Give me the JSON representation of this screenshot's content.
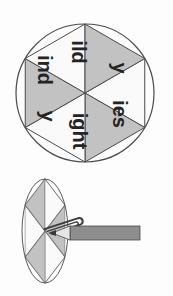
{
  "document": {
    "title": "Word Ending Spinner Worksheet",
    "orientation": "rotated-90-clockwise",
    "background_color": "#fdfdfd"
  },
  "palette": {
    "sector_gray": "#c2c2c2",
    "sector_white": "#fafafa",
    "outline": "#4a4a4a",
    "text": "#242424",
    "pencil_body": "#8e8e8e",
    "pencil_wood": "#e6e6e6",
    "pencil_lead": "#3a3a3a",
    "paperclip": "#3d3d3d"
  },
  "main_spinner": {
    "name": "word-ending-spinner",
    "shape": "circle",
    "sector_count": 6,
    "center_x": 85,
    "center_y": 93,
    "radius": 69,
    "sectors": [
      {
        "label": "ild",
        "fill": "white",
        "start_angle": -30,
        "end_angle": 30,
        "label_angle": 0,
        "label_radius": 41
      },
      {
        "label": "y",
        "fill": "gray",
        "start_angle": 30,
        "end_angle": 90,
        "label_angle": 60,
        "label_radius": 41
      },
      {
        "label": "ies",
        "fill": "white",
        "start_angle": 90,
        "end_angle": 150,
        "label_angle": 120,
        "label_radius": 41
      },
      {
        "label": "ight",
        "fill": "gray",
        "start_angle": 150,
        "end_angle": 210,
        "label_angle": 180,
        "label_radius": 41
      },
      {
        "label": "y",
        "fill": "white",
        "start_angle": 210,
        "end_angle": 270,
        "label_angle": 240,
        "label_radius": 41
      },
      {
        "label": "ind",
        "fill": "gray",
        "start_angle": 270,
        "end_angle": 330,
        "label_angle": 300,
        "label_radius": 41
      }
    ]
  },
  "demo_spinner": {
    "name": "pencil-paperclip-spinner-demo",
    "shape": "ellipse",
    "center_x": 45,
    "center_y": 231,
    "radius_x": 23,
    "radius_y": 52,
    "sector_count": 6,
    "sectors": [
      {
        "fill": "gray",
        "start_angle": -30,
        "end_angle": 30
      },
      {
        "fill": "white",
        "start_angle": 30,
        "end_angle": 90
      },
      {
        "fill": "gray",
        "start_angle": 90,
        "end_angle": 150
      },
      {
        "fill": "white",
        "start_angle": 150,
        "end_angle": 210
      },
      {
        "fill": "gray",
        "start_angle": 210,
        "end_angle": 270
      },
      {
        "fill": "white",
        "start_angle": 270,
        "end_angle": 330
      }
    ]
  },
  "pencil": {
    "name": "pencil",
    "body_x": 70,
    "body_y": 226,
    "body_width": 70,
    "body_height": 14,
    "tip_x": 49,
    "tip_direction": "left"
  },
  "paperclip": {
    "name": "paperclip-pointer",
    "pivot_x": 45,
    "pivot_y": 231,
    "angle_deg": -72
  }
}
